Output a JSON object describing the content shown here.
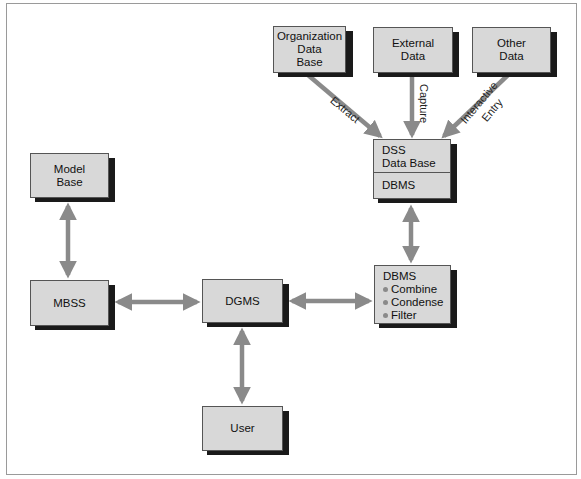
{
  "colors": {
    "box_fill": "#d8d8d8",
    "box_border": "#555555",
    "shadow": "#1a1a1a",
    "arrow": "#8a8a8a",
    "frame": "#9a9a9a"
  },
  "nodes": {
    "organization_data_base": {
      "lines": [
        "Organization",
        "Data",
        "Base"
      ]
    },
    "external_data": {
      "lines": [
        "External",
        "Data"
      ]
    },
    "other_data": {
      "lines": [
        "Other",
        "Data"
      ]
    },
    "dss_data_base": {
      "lines": [
        "DSS",
        "Data Base"
      ],
      "sub": "DBMS"
    },
    "dbms_processing": {
      "title": "DBMS",
      "bullets": [
        "Combine",
        "Condense",
        "Filter"
      ]
    },
    "model_base": {
      "lines": [
        "Model",
        "Base"
      ]
    },
    "mbss": {
      "lines": [
        "MBSS"
      ]
    },
    "dgms": {
      "lines": [
        "DGMS"
      ]
    },
    "user": {
      "lines": [
        "User"
      ]
    }
  },
  "edges": [
    {
      "from": "organization_data_base",
      "to": "dss_data_base",
      "label": "Extract",
      "direction": "one-way"
    },
    {
      "from": "external_data",
      "to": "dss_data_base",
      "label": "Capture",
      "direction": "one-way"
    },
    {
      "from": "other_data",
      "to": "dss_data_base",
      "label": "Interactive Entry",
      "label_lines": [
        "Interactive",
        "Entry"
      ],
      "direction": "one-way"
    },
    {
      "from": "dss_data_base",
      "to": "dbms_processing",
      "label": "",
      "direction": "two-way"
    },
    {
      "from": "dgms",
      "to": "dbms_processing",
      "label": "",
      "direction": "two-way"
    },
    {
      "from": "mbss",
      "to": "dgms",
      "label": "",
      "direction": "two-way"
    },
    {
      "from": "model_base",
      "to": "mbss",
      "label": "",
      "direction": "two-way"
    },
    {
      "from": "dgms",
      "to": "user",
      "label": "",
      "direction": "two-way"
    }
  ]
}
